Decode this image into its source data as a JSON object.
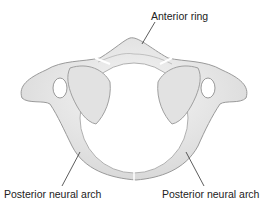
{
  "diagram": {
    "labels": {
      "anterior_ring": "Anterior ring",
      "posterior_left": "Posterior neural arch",
      "posterior_right": "Posterior neural arch"
    },
    "colors": {
      "bone_fill": "#ececec",
      "bone_shade": "#d6d6d6",
      "outline": "#9a9a9a",
      "leader": "#333333",
      "text": "#222222"
    }
  }
}
